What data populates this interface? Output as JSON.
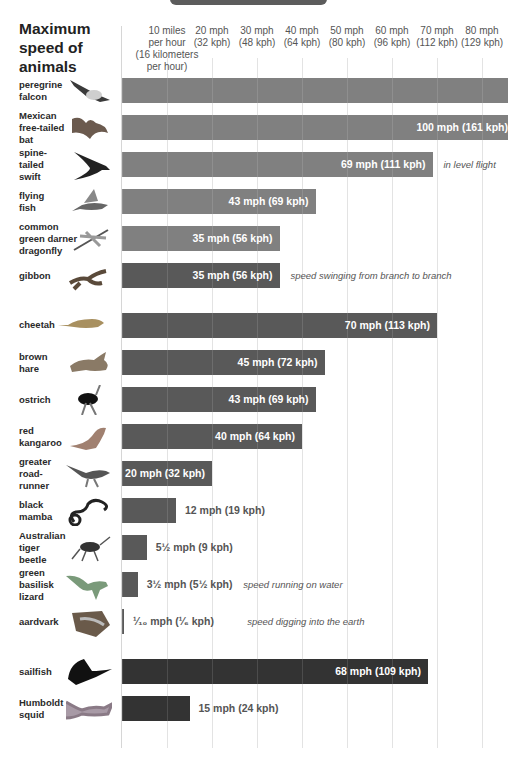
{
  "chart_data": {
    "type": "bar",
    "orientation": "horizontal",
    "title": "Maximum speed of animals",
    "xlabel": "speed",
    "ylabel": "",
    "xlim": [
      0,
      85
    ],
    "grid": true,
    "ticks": [
      {
        "value": 10,
        "label": "10 miles per hour (16 kilometers per hour)"
      },
      {
        "value": 20,
        "label": "20 mph (32 kph)"
      },
      {
        "value": 30,
        "label": "30 mph (48 kph)"
      },
      {
        "value": 40,
        "label": "40 mph (64 kph)"
      },
      {
        "value": 50,
        "label": "50 mph (80 kph)"
      },
      {
        "value": 60,
        "label": "60 mph (96 kph)"
      },
      {
        "value": 70,
        "label": "70 mph (112 kph)"
      },
      {
        "value": 80,
        "label": "80 mph (129 kph)"
      }
    ],
    "groups": [
      {
        "name": "air",
        "color": "#808080"
      },
      {
        "name": "land",
        "color": "#595959"
      },
      {
        "name": "water",
        "color": "#333333"
      }
    ],
    "categories": [
      "peregrine falcon",
      "Mexican free-tailed bat",
      "spine-tailed swift",
      "flying fish",
      "common green darner dragonfly",
      "gibbon",
      "cheetah",
      "brown hare",
      "ostrich",
      "red kangaroo",
      "greater road-runner",
      "black mamba",
      "Australian tiger beetle",
      "green basilisk lizard",
      "aardvark",
      "sailfish",
      "Humboldt squid"
    ],
    "series": [
      {
        "name": "speed_mph",
        "values": [
          90,
          100,
          69,
          43,
          35,
          35,
          70,
          45,
          43,
          40,
          20,
          12,
          5.5,
          3.5,
          0.1,
          68,
          15
        ]
      },
      {
        "name": "speed_kph",
        "values": [
          null,
          161,
          111,
          69,
          56,
          56,
          113,
          72,
          69,
          64,
          32,
          19,
          9,
          5.5,
          0.17,
          109,
          24
        ]
      }
    ],
    "notes": {
      "spine-tailed swift": "in level flight",
      "gibbon": "speed swinging from branch to branch",
      "green basilisk lizard": "speed running on water",
      "aardvark": "speed digging into the earth"
    }
  },
  "title": "Maximum speed of animals",
  "ticks": [
    {
      "label": "10 miles\nper hour\n(16 kilometers\nper hour)",
      "x": 167
    },
    {
      "label": "20 mph\n(32 kph)",
      "x": 212
    },
    {
      "label": "30 mph\n(48 kph)",
      "x": 257
    },
    {
      "label": "40 mph\n(64 kph)",
      "x": 302
    },
    {
      "label": "50 mph\n(80 kph)",
      "x": 347
    },
    {
      "label": "60 mph\n(96 kph)",
      "x": 392
    },
    {
      "label": "70 mph\n(112 kph)",
      "x": 437
    },
    {
      "label": "80 mph\n(129 kph)",
      "x": 482
    }
  ],
  "rows": [
    {
      "label": "peregrine\nfalcon",
      "icon": "falcon-icon",
      "group": "air",
      "top": 78,
      "mph": 90,
      "text": "",
      "inside": true,
      "note": ""
    },
    {
      "label": "Mexican\nfree-tailed\nbat",
      "icon": "bat-icon",
      "group": "air",
      "top": 115,
      "mph": 100,
      "text": "100 mph (161 kph)",
      "inside": true,
      "note": ""
    },
    {
      "label": "spine-\ntailed\nswift",
      "icon": "swift-icon",
      "group": "air",
      "top": 152,
      "mph": 69,
      "text": "69 mph (111 kph)",
      "inside": true,
      "note": "in level flight"
    },
    {
      "label": "flying\nfish",
      "icon": "flying-fish-icon",
      "group": "air",
      "top": 189,
      "mph": 43,
      "text": "43 mph (69 kph)",
      "inside": true,
      "note": ""
    },
    {
      "label": "common\ngreen darner\ndragonfly",
      "icon": "dragonfly-icon",
      "group": "air",
      "top": 226,
      "mph": 35,
      "text": "35 mph (56 kph)",
      "inside": true,
      "note": ""
    },
    {
      "label": "gibbon",
      "icon": "gibbon-icon",
      "group": "land",
      "top": 263,
      "mph": 35,
      "text": "35 mph (56 kph)",
      "inside": true,
      "note": "speed swinging from branch to branch"
    },
    {
      "label": "cheetah",
      "icon": "cheetah-icon",
      "group": "land",
      "top": 313,
      "mph": 70,
      "text": "70 mph (113 kph)",
      "inside": true,
      "note": ""
    },
    {
      "label": "brown\nhare",
      "icon": "hare-icon",
      "group": "land",
      "top": 350,
      "mph": 45,
      "text": "45 mph (72 kph)",
      "inside": true,
      "note": ""
    },
    {
      "label": "ostrich",
      "icon": "ostrich-icon",
      "group": "land",
      "top": 387,
      "mph": 43,
      "text": "43 mph (69 kph)",
      "inside": true,
      "note": ""
    },
    {
      "label": "red\nkangaroo",
      "icon": "kangaroo-icon",
      "group": "land",
      "top": 424,
      "mph": 40,
      "text": "40 mph (64 kph)",
      "inside": true,
      "note": ""
    },
    {
      "label": "greater\nroad-\nrunner",
      "icon": "roadrunner-icon",
      "group": "land",
      "top": 461,
      "mph": 20,
      "text": "20 mph (32 kph)",
      "inside": true,
      "note": ""
    },
    {
      "label": "black\nmamba",
      "icon": "snake-icon",
      "group": "land",
      "top": 498,
      "mph": 12,
      "text": "12 mph (19 kph)",
      "inside": false,
      "note": ""
    },
    {
      "label": "Australian\ntiger\nbeetle",
      "icon": "beetle-icon",
      "group": "land",
      "top": 535,
      "mph": 5.5,
      "text": "5½ mph (9 kph)",
      "inside": false,
      "note": ""
    },
    {
      "label": "green\nbasilisk\nlizard",
      "icon": "lizard-icon",
      "group": "land",
      "top": 572,
      "mph": 3.5,
      "text": "3½ mph (5½ kph)",
      "inside": false,
      "note": "speed running on water"
    },
    {
      "label": "aardvark",
      "icon": "aardvark-icon",
      "group": "land",
      "top": 609,
      "mph": 0.3,
      "text": "¹⁄₁₀ mph (¹⁄₆ kph)",
      "inside": false,
      "note": "speed digging into the earth"
    },
    {
      "label": "sailfish",
      "icon": "sailfish-icon",
      "group": "water",
      "top": 659,
      "mph": 68,
      "text": "68 mph (109 kph)",
      "inside": true,
      "note": ""
    },
    {
      "label": "Humboldt\nsquid",
      "icon": "squid-icon",
      "group": "water",
      "top": 696,
      "mph": 15,
      "text": "15 mph (24 kph)",
      "inside": false,
      "note": ""
    }
  ]
}
